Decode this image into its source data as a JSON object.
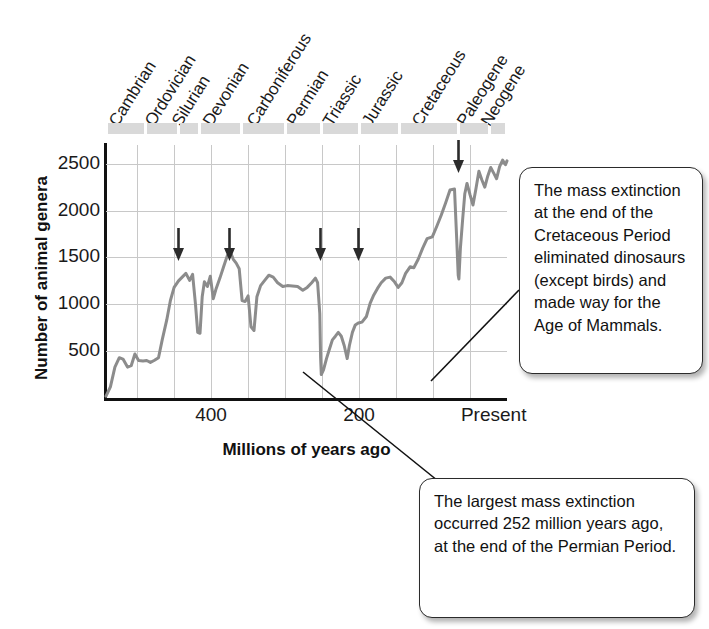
{
  "chart_data": {
    "type": "line",
    "title": "",
    "xlabel": "Millions of years ago",
    "ylabel": "Number of animal genera",
    "xlim": [
      542,
      0
    ],
    "ylim": [
      0,
      2700
    ],
    "x_ticks": [
      {
        "value": 400,
        "label": "400"
      },
      {
        "value": 200,
        "label": "200"
      },
      {
        "value": 0,
        "label": "Present"
      }
    ],
    "y_ticks": [
      500,
      1000,
      1500,
      2000,
      2500
    ],
    "grid": true,
    "legend": null,
    "series": [
      {
        "name": "Number of animal genera",
        "color": "#8c8c8c",
        "points": [
          [
            542,
            20
          ],
          [
            536,
            120
          ],
          [
            530,
            330
          ],
          [
            524,
            430
          ],
          [
            519,
            415
          ],
          [
            513,
            330
          ],
          [
            508,
            345
          ],
          [
            503,
            470
          ],
          [
            498,
            400
          ],
          [
            492,
            395
          ],
          [
            487,
            400
          ],
          [
            482,
            380
          ],
          [
            477,
            400
          ],
          [
            471,
            430
          ],
          [
            466,
            620
          ],
          [
            460,
            830
          ],
          [
            455,
            1040
          ],
          [
            450,
            1180
          ],
          [
            444,
            1250
          ],
          [
            439,
            1290
          ],
          [
            434,
            1330
          ],
          [
            429,
            1255
          ],
          [
            425,
            1320
          ],
          [
            421,
            1000
          ],
          [
            418,
            700
          ],
          [
            415,
            690
          ],
          [
            412,
            1080
          ],
          [
            409,
            1240
          ],
          [
            405,
            1190
          ],
          [
            401,
            1300
          ],
          [
            397,
            1060
          ],
          [
            393,
            1170
          ],
          [
            388,
            1280
          ],
          [
            383,
            1400
          ],
          [
            378,
            1520
          ],
          [
            374,
            1560
          ],
          [
            370,
            1480
          ],
          [
            366,
            1440
          ],
          [
            362,
            1380
          ],
          [
            358,
            1040
          ],
          [
            354,
            1030
          ],
          [
            350,
            1090
          ],
          [
            346,
            760
          ],
          [
            342,
            720
          ],
          [
            338,
            1080
          ],
          [
            333,
            1200
          ],
          [
            328,
            1250
          ],
          [
            322,
            1310
          ],
          [
            316,
            1290
          ],
          [
            310,
            1230
          ],
          [
            303,
            1190
          ],
          [
            297,
            1200
          ],
          [
            290,
            1195
          ],
          [
            283,
            1190
          ],
          [
            276,
            1150
          ],
          [
            270,
            1180
          ],
          [
            264,
            1230
          ],
          [
            259,
            1280
          ],
          [
            256,
            1230
          ],
          [
            253,
            900
          ],
          [
            252,
            430
          ],
          [
            251,
            250
          ],
          [
            248,
            300
          ],
          [
            244,
            420
          ],
          [
            240,
            520
          ],
          [
            236,
            620
          ],
          [
            232,
            660
          ],
          [
            228,
            700
          ],
          [
            224,
            660
          ],
          [
            220,
            560
          ],
          [
            216,
            420
          ],
          [
            213,
            560
          ],
          [
            209,
            700
          ],
          [
            205,
            780
          ],
          [
            201,
            800
          ],
          [
            196,
            810
          ],
          [
            190,
            870
          ],
          [
            185,
            1010
          ],
          [
            180,
            1100
          ],
          [
            175,
            1170
          ],
          [
            170,
            1230
          ],
          [
            164,
            1280
          ],
          [
            158,
            1290
          ],
          [
            152,
            1240
          ],
          [
            147,
            1180
          ],
          [
            142,
            1230
          ],
          [
            137,
            1330
          ],
          [
            131,
            1400
          ],
          [
            126,
            1390
          ],
          [
            120,
            1480
          ],
          [
            114,
            1600
          ],
          [
            108,
            1700
          ],
          [
            101,
            1720
          ],
          [
            95,
            1830
          ],
          [
            89,
            1950
          ],
          [
            83,
            2080
          ],
          [
            77,
            2220
          ],
          [
            71,
            2230
          ],
          [
            68,
            1700
          ],
          [
            66,
            1310
          ],
          [
            65,
            1270
          ],
          [
            63,
            1600
          ],
          [
            60,
            1900
          ],
          [
            57,
            2180
          ],
          [
            54,
            2290
          ],
          [
            50,
            2170
          ],
          [
            46,
            2060
          ],
          [
            42,
            2230
          ],
          [
            38,
            2420
          ],
          [
            34,
            2330
          ],
          [
            30,
            2250
          ],
          [
            26,
            2370
          ],
          [
            22,
            2460
          ],
          [
            18,
            2400
          ],
          [
            14,
            2340
          ],
          [
            10,
            2470
          ],
          [
            6,
            2540
          ],
          [
            2,
            2490
          ],
          [
            0,
            2530
          ]
        ]
      }
    ],
    "geologic_periods": [
      {
        "name": "Cambrian",
        "start": 542,
        "end": 488
      },
      {
        "name": "Ordovician",
        "start": 488,
        "end": 444
      },
      {
        "name": "Silurian",
        "start": 444,
        "end": 416
      },
      {
        "name": "Devonian",
        "start": 416,
        "end": 359
      },
      {
        "name": "Carboniferous",
        "start": 359,
        "end": 299
      },
      {
        "name": "Permian",
        "start": 299,
        "end": 251
      },
      {
        "name": "Triassic",
        "start": 251,
        "end": 200
      },
      {
        "name": "Jurassic",
        "start": 200,
        "end": 145
      },
      {
        "name": "Cretaceous",
        "start": 145,
        "end": 66
      },
      {
        "name": "Paleogene",
        "start": 66,
        "end": 23
      },
      {
        "name": "Neogene",
        "start": 23,
        "end": 0
      }
    ],
    "extinction_markers": [
      {
        "label": "End-Ordovician",
        "x": 444
      },
      {
        "label": "Late Devonian",
        "x": 375
      },
      {
        "label": "End-Permian",
        "x": 252
      },
      {
        "label": "End-Triassic",
        "x": 201
      },
      {
        "label": "End-Cretaceous",
        "x": 66
      }
    ],
    "annotations": [
      {
        "id": "cretaceous",
        "text": "The mass extinction at the end of the Cretaceous Period eliminated dinosaurs (except birds) and made way for the Age of Mammals."
      },
      {
        "id": "permian",
        "text": "The largest mass extinction occurred 252 million years ago, at the end of the Permian Period."
      }
    ]
  },
  "colors": {
    "curve": "#8c8c8c",
    "axis": "#111111",
    "grid": "#c8c8c8",
    "period_band": "#d9d9d9",
    "arrow": "#2b2b2b",
    "callout_border": "#2b2b2b",
    "text": "#1a1a1a"
  },
  "axis": {
    "y_label": "Number of animal genera",
    "x_label": "Millions of years ago",
    "y_ticks": [
      "2500",
      "2000",
      "1500",
      "1000",
      "500"
    ],
    "x_ticks": [
      "400",
      "200",
      "Present"
    ]
  },
  "periods": [
    "Cambrian",
    "Ordovician",
    "Silurian",
    "Devonian",
    "Carboniferous",
    "Permian",
    "Triassic",
    "Jurassic",
    "Cretaceous",
    "Paleogene",
    "Neogene"
  ],
  "callouts": {
    "cretaceous": "The mass extinction at the end of the Cretaceous Period eliminated dinosaurs (except birds) and made way for the Age of Mammals.",
    "permian": "The largest mass extinction occurred 252 million years ago, at the end of the Permian Period."
  }
}
